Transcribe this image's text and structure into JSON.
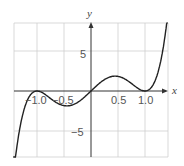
{
  "chart_data": {
    "type": "line",
    "title": "",
    "xlabel": "x",
    "ylabel": "y",
    "xlim": [
      -1.5,
      1.4
    ],
    "ylim": [
      -8.5,
      8.5
    ],
    "grid": true,
    "x_tick_labels": [
      "−1.0",
      "−0.5",
      "0.5",
      "1.0"
    ],
    "x_ticks": [
      -1.0,
      -0.5,
      0.5,
      1.0
    ],
    "y_tick_labels": [
      "5",
      "−5"
    ],
    "y_ticks": [
      5,
      -5
    ],
    "series": [
      {
        "name": "f(x)",
        "function": "6.5*x*(x^2-1)^2",
        "x": [
          -1.5,
          -1.4,
          -1.3,
          -1.2,
          -1.1,
          -1.0,
          -0.9,
          -0.8,
          -0.7,
          -0.6,
          -0.5,
          -0.4,
          -0.3,
          -0.2,
          -0.1,
          0.0,
          0.1,
          0.2,
          0.3,
          0.4,
          0.5,
          0.6,
          0.7,
          0.8,
          0.9,
          1.0,
          1.1,
          1.2,
          1.3,
          1.4
        ],
        "y": [
          -15.2,
          -8.4,
          -3.9,
          -1.5,
          -0.3,
          0.0,
          -0.2,
          -0.7,
          -1.2,
          -1.6,
          -1.8,
          -1.8,
          -1.6,
          -1.2,
          -0.6,
          0.0,
          0.6,
          1.2,
          1.6,
          1.8,
          1.8,
          1.6,
          1.2,
          0.7,
          0.2,
          0.0,
          0.3,
          1.5,
          3.9,
          8.4
        ]
      }
    ]
  },
  "labels": {
    "x_axis": "x",
    "y_axis": "y",
    "tick_neg1": "−1.0",
    "tick_neg05": "−0.5",
    "tick_05": "0.5",
    "tick_1": "1.0",
    "tick_y5": "5",
    "tick_yneg5": "−5"
  }
}
